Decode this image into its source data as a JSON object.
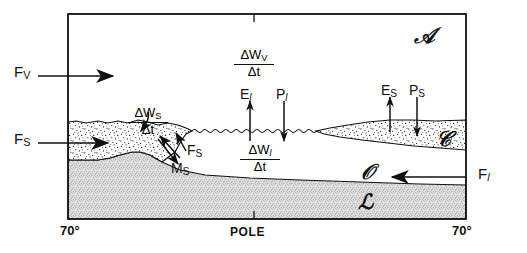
{
  "figure": {
    "axis": {
      "left_label": "70°",
      "center_label": "POLE",
      "right_label": "70°"
    },
    "domains": [
      {
        "id": "atmosphere",
        "symbol": "𝒜",
        "name": "atmosphere"
      },
      {
        "id": "cryosphere",
        "symbol": "𝒞",
        "name": "cryosphere"
      },
      {
        "id": "ocean",
        "symbol": "𝒪",
        "name": "ocean"
      },
      {
        "id": "land",
        "symbol": "ℒ",
        "name": "land"
      }
    ],
    "fluxes": {
      "f_v": {
        "base": "F",
        "sub": "V",
        "desc": "vapor flux into atmosphere"
      },
      "f_s": {
        "base": "F",
        "sub": "S",
        "desc": "snow/ice flux"
      },
      "f_s_inner": {
        "base": "F",
        "sub": "S",
        "desc": "internal snow/ice flux"
      },
      "f_l": {
        "base": "F",
        "sub": "l",
        "desc": "liquid ocean flux"
      },
      "m_s": {
        "base": "M",
        "sub": "S",
        "desc": "melt of snow/ice"
      },
      "e_l": {
        "base": "E",
        "sub": "l",
        "desc": "evaporation from liquid"
      },
      "p_l": {
        "base": "P",
        "sub": "l",
        "desc": "precipitation onto liquid"
      },
      "e_s": {
        "base": "E",
        "sub": "S",
        "desc": "sublimation from snow/ice"
      },
      "p_s": {
        "base": "P",
        "sub": "S",
        "desc": "precipitation onto snow/ice"
      }
    },
    "storage_terms": {
      "vapor": {
        "num_delta": "Δ",
        "num_var": "W",
        "num_sub": "V",
        "den": "Δt"
      },
      "snow": {
        "num_delta": "Δ",
        "num_var": "W",
        "num_sub": "S",
        "den": "Δt"
      },
      "liquid": {
        "num_delta": "Δ",
        "num_var": "W",
        "num_sub": "l",
        "den": "Δt"
      }
    },
    "colors": {
      "ink": "#111111",
      "snow_fill": "#ffffff",
      "land_fill": "#d8d8d8",
      "background": "#ffffff"
    }
  }
}
